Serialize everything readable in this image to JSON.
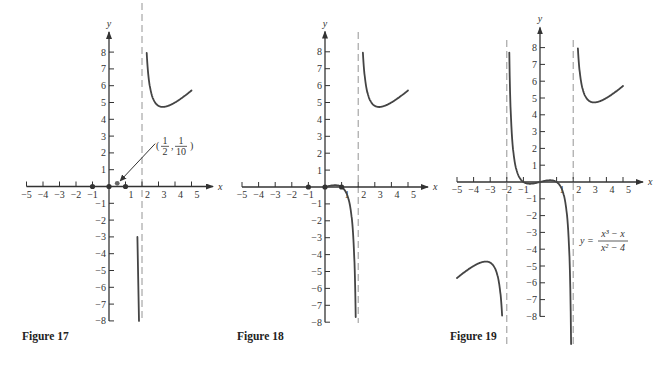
{
  "figures": [
    {
      "caption": "Figure 17",
      "origin": [
        109,
        186.5
      ],
      "unit_x": 16.5,
      "unit_y": 16.8,
      "asymptotes": [
        2
      ],
      "asym_top": 3,
      "asym_bottom": 322,
      "x_ticks": [
        -5,
        -4,
        -3,
        -2,
        -1,
        1,
        2,
        3,
        4,
        5
      ],
      "y_ticks": [
        -8,
        -7,
        -6,
        -5,
        -4,
        -3,
        -2,
        -1,
        1,
        2,
        3,
        4,
        5,
        6,
        7,
        8
      ],
      "x_axis_range": [
        -5,
        6.3
      ],
      "y_axis_range": [
        -8,
        9.2
      ],
      "dots": [
        [
          -1,
          0
        ],
        [
          0,
          0
        ],
        [
          1,
          0
        ]
      ],
      "highlight_point": [
        0.5,
        0.1
      ],
      "annotation": {
        "label_num1": "1",
        "label_den1": "2",
        "label_num2": "1",
        "label_den2": "10",
        "text": "(1/2, 1/10)"
      },
      "caption_pos": [
        22,
        340
      ],
      "segments": [
        "upper",
        "stub17"
      ]
    },
    {
      "caption": "Figure 18",
      "origin": [
        325,
        187
      ],
      "unit_x": 16.6,
      "unit_y": 16.9,
      "asymptotes": [
        2
      ],
      "asym_top": 32,
      "asym_bottom": 323,
      "x_ticks": [
        -5,
        -4,
        -3,
        -2,
        -1,
        1,
        2,
        3,
        4,
        5
      ],
      "y_ticks": [
        -8,
        -7,
        -6,
        -5,
        -4,
        -3,
        -2,
        -1,
        1,
        2,
        3,
        4,
        5,
        6,
        7,
        8
      ],
      "x_axis_range": [
        -5,
        6.2
      ],
      "y_axis_range": [
        -8,
        9.2
      ],
      "dots": [
        [
          -1,
          0
        ],
        [
          0,
          0
        ],
        [
          1,
          0
        ]
      ],
      "caption_pos": [
        237,
        340
      ],
      "segments": [
        "upper",
        "middle_right"
      ]
    },
    {
      "caption": "Figure 19",
      "origin": [
        540,
        182
      ],
      "unit_x": 16.6,
      "unit_y": 16.8,
      "asymptotes": [
        -2,
        2
      ],
      "asym_top": 40,
      "asym_bottom": 348,
      "x_ticks": [
        -5,
        -4,
        -3,
        -2,
        -1,
        1,
        2,
        3,
        4,
        5
      ],
      "y_ticks": [
        -8,
        -7,
        -6,
        -5,
        -4,
        -3,
        -2,
        -1,
        1,
        2,
        3,
        4,
        5,
        6,
        7,
        8
      ],
      "x_axis_range": [
        -5,
        6.2
      ],
      "y_axis_range": [
        -8,
        9.2
      ],
      "dots": [],
      "equation": {
        "lhs": "y =",
        "num": "x³ − x",
        "den": "x² − 4"
      },
      "caption_pos": [
        450,
        340
      ],
      "segments": [
        "upper",
        "middle_full",
        "lower_left"
      ]
    }
  ],
  "axis_labels": {
    "x": "x",
    "y": "y"
  },
  "chart_data": [
    {
      "type": "line",
      "title": "Figure 17",
      "function": "",
      "xlabel": "x",
      "ylabel": "y",
      "xlim": [
        -5,
        5
      ],
      "ylim": [
        -8,
        8
      ],
      "x_ticks": [
        -5,
        -4,
        -3,
        -2,
        -1,
        1,
        2,
        3,
        4,
        5
      ],
      "y_ticks": [
        -8,
        -7,
        -6,
        -5,
        -4,
        -3,
        -2,
        -1,
        1,
        2,
        3,
        4,
        5,
        6,
        7,
        8
      ],
      "vertical_asymptotes": [
        2
      ],
      "points": [
        [
          -1,
          0
        ],
        [
          0,
          0
        ],
        [
          0.5,
          0.1
        ],
        [
          1,
          0
        ]
      ],
      "annotations": [
        "(1/2, 1/10)"
      ],
      "series": [
        {
          "name": "right branch (x>2)",
          "x": [
            2.05,
            2.2,
            2.5,
            3,
            3.3,
            3.5,
            4,
            4.5,
            5
          ],
          "y": [
            8,
            7.2,
            5.8,
            4.8,
            4.7,
            4.7,
            4.9,
            5.2,
            5.7
          ]
        },
        {
          "name": "left of asymptote fragment",
          "x": [
            1.75,
            1.85
          ],
          "y": [
            -3,
            -8
          ]
        }
      ],
      "grid": false
    },
    {
      "type": "line",
      "title": "Figure 18",
      "xlabel": "x",
      "ylabel": "y",
      "xlim": [
        -5,
        5
      ],
      "ylim": [
        -8,
        8
      ],
      "x_ticks": [
        -5,
        -4,
        -3,
        -2,
        -1,
        1,
        2,
        3,
        4,
        5
      ],
      "y_ticks": [
        -8,
        -7,
        -6,
        -5,
        -4,
        -3,
        -2,
        -1,
        1,
        2,
        3,
        4,
        5,
        6,
        7,
        8
      ],
      "vertical_asymptotes": [
        2
      ],
      "points": [
        [
          -1,
          0
        ],
        [
          0,
          0
        ],
        [
          1,
          0
        ]
      ],
      "series": [
        {
          "name": "branch 0<x<2",
          "x": [
            0,
            0.5,
            1,
            1.5,
            1.8,
            1.85
          ],
          "y": [
            0,
            0.1,
            0,
            -0.5,
            -3.6,
            -8
          ]
        },
        {
          "name": "right branch (x>2)",
          "x": [
            2.05,
            2.2,
            2.5,
            3,
            3.3,
            4,
            5
          ],
          "y": [
            8,
            7.2,
            5.8,
            4.8,
            4.7,
            4.9,
            5.7
          ]
        }
      ],
      "grid": false
    },
    {
      "type": "line",
      "title": "Figure 19",
      "function": "y = (x^3 - x)/(x^2 - 4)",
      "xlabel": "x",
      "ylabel": "y",
      "xlim": [
        -5,
        5
      ],
      "ylim": [
        -8,
        8
      ],
      "x_ticks": [
        -5,
        -4,
        -3,
        -2,
        -1,
        1,
        2,
        3,
        4,
        5
      ],
      "y_ticks": [
        -8,
        -7,
        -6,
        -5,
        -4,
        -3,
        -2,
        -1,
        1,
        2,
        3,
        4,
        5,
        6,
        7,
        8
      ],
      "vertical_asymptotes": [
        -2,
        2
      ],
      "series": [
        {
          "name": "left branch (x<-2)",
          "x": [
            -5,
            -4.5,
            -4,
            -3.3,
            -3,
            -2.5,
            -2.2,
            -2.05
          ],
          "y": [
            -5.7,
            -5.2,
            -4.9,
            -4.7,
            -4.8,
            -5.8,
            -7.2,
            -8
          ]
        },
        {
          "name": "middle branch (-2<x<2)",
          "x": [
            -1.85,
            -1.5,
            -1,
            -0.5,
            0,
            0.5,
            1,
            1.5,
            1.9
          ],
          "y": [
            8,
            0.5,
            0,
            -0.1,
            0,
            0.1,
            0,
            -0.5,
            -12
          ]
        },
        {
          "name": "right branch (x>2)",
          "x": [
            2.05,
            2.2,
            2.5,
            3,
            3.3,
            4,
            5
          ],
          "y": [
            8,
            7.2,
            5.8,
            4.8,
            4.7,
            4.9,
            5.7
          ]
        }
      ],
      "grid": false
    }
  ]
}
